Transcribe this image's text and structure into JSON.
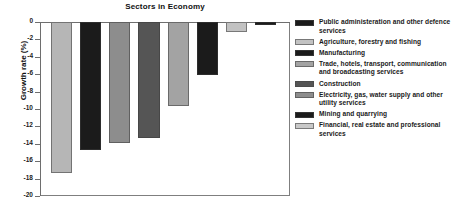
{
  "chart_data": {
    "type": "bar",
    "title": "Sectors in Economy",
    "xlabel": "",
    "ylabel": "Growth rate (%)",
    "ylim": [
      -20,
      0
    ],
    "yticks": [
      "0",
      "-2",
      "-4",
      "-6",
      "-8",
      "-10",
      "-12",
      "-14",
      "-16",
      "-18",
      "-20"
    ],
    "ytick_values": [
      0,
      -2,
      -4,
      -6,
      -8,
      -10,
      -12,
      -14,
      -16,
      -18,
      -20
    ],
    "grid": false,
    "legend_position": "right",
    "categories": [
      "Agriculture, forestry and fishing",
      "Mining and quarrying",
      "Manufacturing",
      "Electricity, gas, water supply and other utility services",
      "Construction",
      "Trade, hotels, transport, communication and broadcasting services",
      "Financial, real estate and professional services",
      "Public administeration and other defence services"
    ],
    "values": [
      -17.3,
      -14.7,
      -13.9,
      -13.3,
      -9.6,
      -6.1,
      -1.1,
      -0.3
    ],
    "colors": [
      "#b6b6b6",
      "#1b1b1b",
      "#8d8d8d",
      "#555555",
      "#a3a3a3",
      "#1b1b1b",
      "#c2c2c2",
      "#1b1b1b"
    ]
  },
  "legend": {
    "items": [
      {
        "label": "Public administeration and other defence services",
        "color": "#1b1b1b"
      },
      {
        "label": "Agriculture, forestry and fishing",
        "color": "#c2c2c2"
      },
      {
        "label": "Manufacturing",
        "color": "#1b1b1b"
      },
      {
        "label": "Trade, hotels, transport, communication and broadcasting services",
        "color": "#a3a3a3"
      },
      {
        "label": "Construction",
        "color": "#555555"
      },
      {
        "label": "Electricity, gas, water supply and other utility services",
        "color": "#8d8d8d"
      },
      {
        "label": "Mining and quarrying",
        "color": "#1b1b1b"
      },
      {
        "label": "Financial, real estate and professional services",
        "color": "#c8c8c8"
      }
    ]
  }
}
